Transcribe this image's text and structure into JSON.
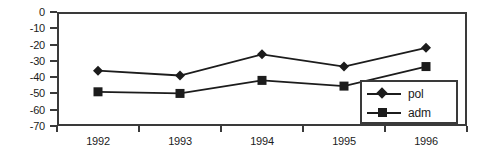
{
  "chart_data": {
    "type": "line",
    "title": "",
    "subtitle": "",
    "xlabel": "",
    "ylabel": "",
    "categories": [
      "1992",
      "1993",
      "1994",
      "1995",
      "1996"
    ],
    "series": [
      {
        "name": "pol",
        "marker": "diamond",
        "color": "#1c1c1c",
        "values": [
          -36,
          -39,
          -26,
          -33.5,
          -22
        ]
      },
      {
        "name": "adm",
        "marker": "square",
        "color": "#1c1c1c",
        "values": [
          -49,
          -50,
          -42,
          -45.5,
          -33.5
        ]
      }
    ],
    "ylim": [
      -70,
      0
    ],
    "yticks": [
      0,
      -10,
      -20,
      -30,
      -40,
      -50,
      -60,
      -70
    ],
    "ytick_labels": [
      "0",
      "-10",
      "-20",
      "-30",
      "-40",
      "-50",
      "-60",
      "-70"
    ],
    "xlim": [
      0,
      6
    ],
    "grid": false,
    "legend_position": "bottom-right-inside",
    "legend_entries": [
      "pol",
      "adm"
    ],
    "frame_color": "#3a3a3a",
    "background": "#ffffff"
  }
}
